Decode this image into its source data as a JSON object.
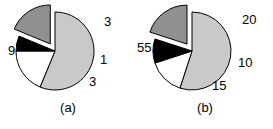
{
  "figure": {
    "background_color": "#ffffff",
    "panel_count": 2
  },
  "colors": {
    "light_gray": "#c9c9c9",
    "dark_gray": "#909090",
    "black": "#000000",
    "white": "#ffffff",
    "outline": "#000000",
    "text": "#000000"
  },
  "chart_data": [
    {
      "type": "pie",
      "title": "(a)",
      "caption": "(a)",
      "labels": [
        "9",
        "3",
        "1",
        "3"
      ],
      "values": [
        9,
        3,
        1,
        3
      ],
      "total": 16,
      "slice_colors": [
        "#c9c9c9",
        "#909090",
        "#000000",
        "#ffffff"
      ],
      "exploded": [
        false,
        true,
        false,
        false
      ],
      "start_angle_deg": 0,
      "direction": "clockwise",
      "legend": "none",
      "grid": false,
      "label_positions": [
        "left",
        "upper-right",
        "right",
        "lower-right"
      ],
      "annotations": {
        "label_9": "9",
        "label_3_top": "3",
        "label_1": "1",
        "label_3_bottom": "3"
      }
    },
    {
      "type": "pie",
      "title": "(b)",
      "caption": "(b)",
      "labels": [
        "55",
        "20",
        "10",
        "15"
      ],
      "values": [
        55,
        20,
        10,
        15
      ],
      "total": 100,
      "slice_colors": [
        "#c9c9c9",
        "#909090",
        "#000000",
        "#ffffff"
      ],
      "exploded": [
        false,
        true,
        false,
        false
      ],
      "start_angle_deg": 0,
      "direction": "clockwise",
      "legend": "none",
      "grid": false,
      "label_positions": [
        "left",
        "upper-right",
        "right",
        "lower-right"
      ],
      "annotations": {
        "label_55": "55",
        "label_20": "20",
        "label_10": "10",
        "label_15": "15"
      }
    }
  ],
  "panel_a": {
    "caption": "(a)",
    "label_left": "9",
    "label_upper_right": "3",
    "label_right": "1",
    "label_lower_right": "3"
  },
  "panel_b": {
    "caption": "(b)",
    "label_left": "55",
    "label_upper_right": "20",
    "label_right": "10",
    "label_lower_right": "15"
  }
}
